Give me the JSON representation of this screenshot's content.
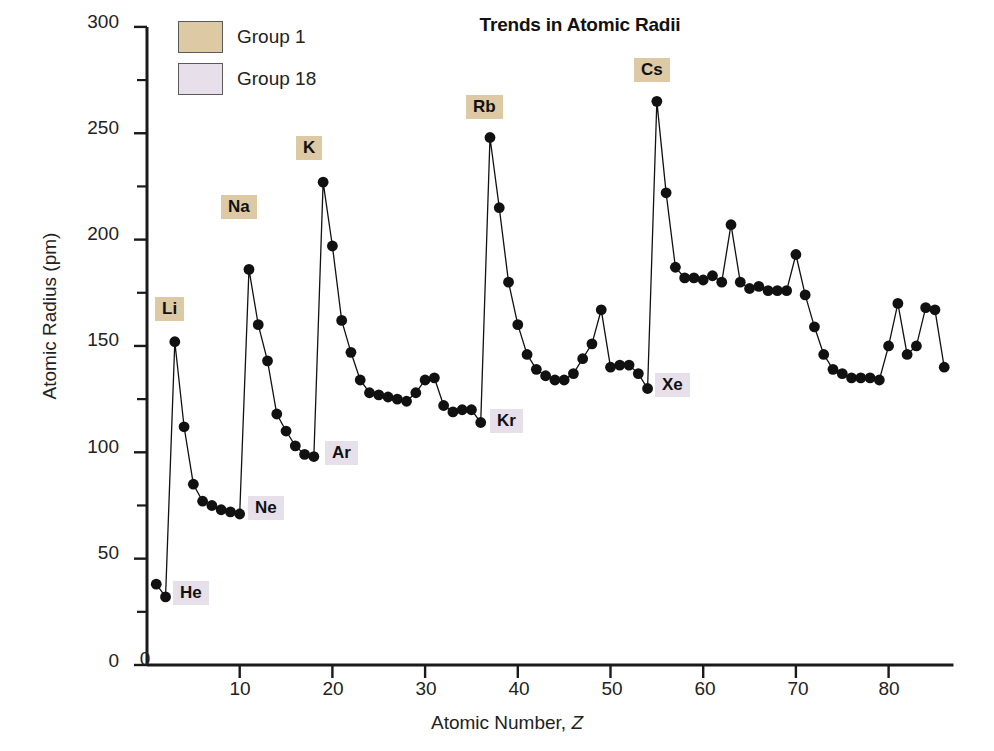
{
  "chart_data": {
    "type": "line",
    "title": "Trends in Atomic Radii",
    "xlabel": "Atomic Number, Z",
    "ylabel": "Atomic Radius (pm)",
    "xlim": [
      0,
      87
    ],
    "ylim": [
      0,
      300
    ],
    "xticks": [
      0,
      10,
      20,
      30,
      40,
      50,
      60,
      70,
      80
    ],
    "yticks": [
      0,
      50,
      100,
      150,
      200,
      250,
      300
    ],
    "yminorticks": [
      25,
      75,
      125,
      175,
      225,
      275
    ],
    "grid": false,
    "legend_position": "top-left",
    "marker": "filled-circle",
    "x": [
      1,
      2,
      3,
      4,
      5,
      6,
      7,
      8,
      9,
      10,
      11,
      12,
      13,
      14,
      15,
      16,
      17,
      18,
      19,
      20,
      21,
      22,
      23,
      24,
      25,
      26,
      27,
      28,
      29,
      30,
      31,
      32,
      33,
      34,
      35,
      36,
      37,
      38,
      39,
      40,
      41,
      42,
      43,
      44,
      45,
      46,
      47,
      48,
      49,
      50,
      51,
      52,
      53,
      54,
      55,
      56,
      57,
      58,
      59,
      60,
      61,
      62,
      63,
      64,
      65,
      66,
      67,
      68,
      69,
      70,
      71,
      72,
      73,
      74,
      75,
      76,
      77,
      78,
      79,
      80,
      81,
      82,
      83,
      84,
      85,
      86
    ],
    "y": [
      38,
      32,
      152,
      112,
      85,
      77,
      75,
      73,
      72,
      71,
      186,
      160,
      143,
      118,
      110,
      103,
      99,
      98,
      227,
      197,
      162,
      147,
      134,
      128,
      127,
      126,
      125,
      124,
      128,
      134,
      135,
      122,
      119,
      120,
      120,
      114,
      248,
      215,
      180,
      160,
      146,
      139,
      136,
      134,
      134,
      137,
      144,
      151,
      167,
      140,
      141,
      141,
      137,
      130,
      265,
      222,
      187,
      182,
      182,
      181,
      183,
      180,
      207,
      180,
      177,
      178,
      176,
      176,
      176,
      193,
      174,
      159,
      146,
      139,
      137,
      135,
      135,
      135,
      134,
      150,
      170,
      146,
      150,
      168,
      167,
      140
    ],
    "element_symbols": [
      "H",
      "He",
      "Li",
      "Be",
      "B",
      "C",
      "N",
      "O",
      "F",
      "Ne",
      "Na",
      "Mg",
      "Al",
      "Si",
      "P",
      "S",
      "Cl",
      "Ar",
      "K",
      "Ca",
      "Sc",
      "Ti",
      "V",
      "Cr",
      "Mn",
      "Fe",
      "Co",
      "Ni",
      "Cu",
      "Zn",
      "Ga",
      "Ge",
      "As",
      "Se",
      "Br",
      "Kr",
      "Rb",
      "Sr",
      "Y",
      "Zr",
      "Nb",
      "Mo",
      "Tc",
      "Ru",
      "Rh",
      "Pd",
      "Ag",
      "Cd",
      "In",
      "Sn",
      "Sb",
      "Te",
      "I",
      "Xe",
      "Cs",
      "Ba",
      "La",
      "Ce",
      "Pr",
      "Nd",
      "Pm",
      "Sm",
      "Eu",
      "Gd",
      "Tb",
      "Dy",
      "Ho",
      "Er",
      "Tm",
      "Yb",
      "Lu",
      "Hf",
      "Ta",
      "W",
      "Re",
      "Os",
      "Ir",
      "Pt",
      "Au",
      "Hg",
      "Tl",
      "Pb",
      "Bi",
      "Po",
      "At",
      "Rn"
    ],
    "annotations": [
      {
        "text": "Li",
        "group": "Group 1",
        "z": 3,
        "value": 152
      },
      {
        "text": "Na",
        "group": "Group 1",
        "z": 11,
        "value": 186
      },
      {
        "text": "K",
        "group": "Group 1",
        "z": 19,
        "value": 227
      },
      {
        "text": "Rb",
        "group": "Group 1",
        "z": 37,
        "value": 248
      },
      {
        "text": "Cs",
        "group": "Group 1",
        "z": 55,
        "value": 265
      },
      {
        "text": "He",
        "group": "Group 18",
        "z": 2,
        "value": 32
      },
      {
        "text": "Ne",
        "group": "Group 18",
        "z": 10,
        "value": 71
      },
      {
        "text": "Ar",
        "group": "Group 18",
        "z": 18,
        "value": 98
      },
      {
        "text": "Kr",
        "group": "Group 18",
        "z": 36,
        "value": 114
      },
      {
        "text": "Xe",
        "group": "Group 18",
        "z": 54,
        "value": 130
      }
    ],
    "legend": [
      {
        "label": "Group 1",
        "color": "#ddc9a3"
      },
      {
        "label": "Group 18",
        "color": "#e7e0ea"
      }
    ],
    "series_color": "#111111",
    "axis_color": "#1a1a1a"
  },
  "annotation_positions": [
    {
      "name": "Li",
      "left": 155,
      "top": 297
    },
    {
      "name": "Na",
      "left": 221,
      "top": 195
    },
    {
      "name": "K",
      "left": 296,
      "top": 136
    },
    {
      "name": "Rb",
      "left": 466,
      "top": 95
    },
    {
      "name": "Cs",
      "left": 634,
      "top": 58
    },
    {
      "name": "He",
      "left": 173,
      "top": 581
    },
    {
      "name": "Ne",
      "left": 248,
      "top": 496
    },
    {
      "name": "Ar",
      "left": 325,
      "top": 441
    },
    {
      "name": "Kr",
      "left": 490,
      "top": 409
    },
    {
      "name": "Xe",
      "left": 655,
      "top": 373
    }
  ],
  "ytick_positions": [
    {
      "label": "300",
      "top": 11
    },
    {
      "label": "250",
      "top": 117
    },
    {
      "label": "200",
      "top": 223
    },
    {
      "label": "150",
      "top": 329
    },
    {
      "label": "100",
      "top": 436
    },
    {
      "label": "50",
      "top": 542
    },
    {
      "label": "0",
      "top": 650
    }
  ],
  "xtick_positions": [
    {
      "label": "0",
      "left": 120,
      "top": 648
    },
    {
      "label": "10",
      "left": 215,
      "top": 678
    },
    {
      "label": "20",
      "left": 308,
      "top": 678
    },
    {
      "label": "30",
      "left": 401,
      "top": 678
    },
    {
      "label": "40",
      "left": 494,
      "top": 678
    },
    {
      "label": "50",
      "left": 587,
      "top": 678
    },
    {
      "label": "60",
      "left": 680,
      "top": 678
    },
    {
      "label": "70",
      "left": 773,
      "top": 678
    },
    {
      "label": "80",
      "left": 864,
      "top": 678
    }
  ]
}
